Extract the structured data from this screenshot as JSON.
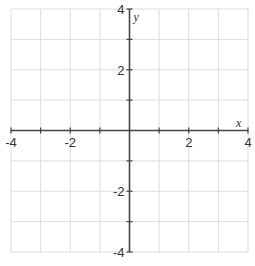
{
  "chart_data": {
    "type": "scatter",
    "title": "",
    "xlabel": "x",
    "ylabel": "y",
    "xlim": [
      -4,
      4
    ],
    "ylim": [
      -4,
      4
    ],
    "grid": true,
    "grid_step": 1,
    "x_ticks": [
      -4,
      -3,
      -2,
      -1,
      0,
      1,
      2,
      3,
      4
    ],
    "y_ticks": [
      -4,
      -3,
      -2,
      -1,
      0,
      1,
      2,
      3,
      4
    ],
    "x_tick_labels": [
      {
        "value": -4,
        "label": "-4"
      },
      {
        "value": -2,
        "label": "-2"
      },
      {
        "value": 2,
        "label": "2"
      },
      {
        "value": 4,
        "label": "4"
      }
    ],
    "y_tick_labels": [
      {
        "value": 4,
        "label": "4"
      },
      {
        "value": 2,
        "label": "2"
      },
      {
        "value": -2,
        "label": "-2"
      },
      {
        "value": -4,
        "label": "-4"
      }
    ],
    "series": [],
    "legend": null
  },
  "colors": {
    "grid": "#dddddd",
    "axis": "#444444",
    "text": "#333333",
    "background": "#ffffff"
  },
  "layout": {
    "x0": 11,
    "x1": 248,
    "y0": 9,
    "y1": 252
  }
}
